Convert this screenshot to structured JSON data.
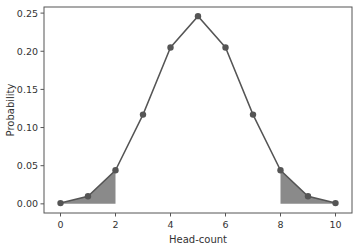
{
  "chart_data": {
    "type": "line",
    "title": "",
    "xlabel": "Head-count",
    "ylabel": "Probability",
    "x": [
      0,
      1,
      2,
      3,
      4,
      5,
      6,
      7,
      8,
      9,
      10
    ],
    "series": [
      {
        "name": "Binomial PMF (n=10, p=0.5)",
        "values": [
          0.001,
          0.01,
          0.044,
          0.117,
          0.205,
          0.246,
          0.205,
          0.117,
          0.044,
          0.01,
          0.001
        ]
      }
    ],
    "shaded_regions": [
      {
        "from": 0,
        "to": 2
      },
      {
        "from": 8,
        "to": 10
      }
    ],
    "xlim": [
      -0.6,
      10.6
    ],
    "ylim": [
      -0.012,
      0.258
    ],
    "xticks": [
      0,
      2,
      4,
      6,
      8,
      10
    ],
    "xtick_labels": [
      "0",
      "2",
      "4",
      "6",
      "8",
      "10"
    ],
    "yticks": [
      0,
      0.05,
      0.1,
      0.15,
      0.2,
      0.25
    ],
    "ytick_labels": [
      "0.00",
      "0.05",
      "0.10",
      "0.15",
      "0.20",
      "0.25"
    ],
    "grid": false,
    "legend": "none",
    "colors": {
      "line": "#555555",
      "marker": "#555555",
      "fill": "#8a8a8a"
    }
  }
}
